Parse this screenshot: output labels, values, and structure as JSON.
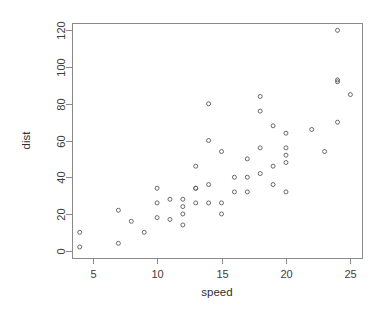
{
  "chart_data": {
    "type": "scatter",
    "title": "",
    "subtitle": "",
    "xlabel": "speed",
    "ylabel": "dist",
    "xlim": [
      3.4,
      25.9
    ],
    "ylim": [
      -4,
      124
    ],
    "xticks": [
      5,
      10,
      15,
      20,
      25
    ],
    "yticks": [
      0,
      20,
      40,
      60,
      80,
      100,
      120
    ],
    "xtick_labels": [
      "5",
      "10",
      "15",
      "20",
      "25"
    ],
    "ytick_labels": [
      "0",
      "20",
      "40",
      "60",
      "80",
      "100",
      "120"
    ],
    "grid": false,
    "legend": null,
    "legend_position": "none",
    "frame": "box",
    "marker": "open-circle",
    "marker_size": 4,
    "point_color": "#5a5a5a",
    "background_color": "#ffffff",
    "n_points": 50,
    "x": [
      4,
      4,
      7,
      7,
      8,
      9,
      10,
      10,
      10,
      11,
      11,
      12,
      12,
      12,
      12,
      13,
      13,
      13,
      13,
      14,
      14,
      14,
      14,
      15,
      15,
      15,
      16,
      16,
      17,
      17,
      17,
      18,
      18,
      18,
      18,
      19,
      19,
      19,
      20,
      20,
      20,
      20,
      20,
      22,
      23,
      24,
      24,
      24,
      24,
      25
    ],
    "y": [
      2,
      10,
      4,
      22,
      16,
      10,
      18,
      26,
      34,
      17,
      28,
      14,
      20,
      24,
      28,
      26,
      34,
      34,
      46,
      26,
      36,
      60,
      80,
      20,
      26,
      54,
      32,
      40,
      32,
      40,
      50,
      42,
      56,
      76,
      84,
      36,
      46,
      68,
      32,
      48,
      52,
      56,
      64,
      66,
      54,
      70,
      92,
      93,
      120,
      85
    ],
    "points": [
      {
        "speed": 4,
        "dist": 2
      },
      {
        "speed": 4,
        "dist": 10
      },
      {
        "speed": 7,
        "dist": 4
      },
      {
        "speed": 7,
        "dist": 22
      },
      {
        "speed": 8,
        "dist": 16
      },
      {
        "speed": 9,
        "dist": 10
      },
      {
        "speed": 10,
        "dist": 18
      },
      {
        "speed": 10,
        "dist": 26
      },
      {
        "speed": 10,
        "dist": 34
      },
      {
        "speed": 11,
        "dist": 17
      },
      {
        "speed": 11,
        "dist": 28
      },
      {
        "speed": 12,
        "dist": 14
      },
      {
        "speed": 12,
        "dist": 20
      },
      {
        "speed": 12,
        "dist": 24
      },
      {
        "speed": 12,
        "dist": 28
      },
      {
        "speed": 13,
        "dist": 26
      },
      {
        "speed": 13,
        "dist": 34
      },
      {
        "speed": 13,
        "dist": 34
      },
      {
        "speed": 13,
        "dist": 46
      },
      {
        "speed": 14,
        "dist": 26
      },
      {
        "speed": 14,
        "dist": 36
      },
      {
        "speed": 14,
        "dist": 60
      },
      {
        "speed": 14,
        "dist": 80
      },
      {
        "speed": 15,
        "dist": 20
      },
      {
        "speed": 15,
        "dist": 26
      },
      {
        "speed": 15,
        "dist": 54
      },
      {
        "speed": 16,
        "dist": 32
      },
      {
        "speed": 16,
        "dist": 40
      },
      {
        "speed": 17,
        "dist": 32
      },
      {
        "speed": 17,
        "dist": 40
      },
      {
        "speed": 17,
        "dist": 50
      },
      {
        "speed": 18,
        "dist": 42
      },
      {
        "speed": 18,
        "dist": 56
      },
      {
        "speed": 18,
        "dist": 76
      },
      {
        "speed": 18,
        "dist": 84
      },
      {
        "speed": 19,
        "dist": 36
      },
      {
        "speed": 19,
        "dist": 46
      },
      {
        "speed": 19,
        "dist": 68
      },
      {
        "speed": 20,
        "dist": 32
      },
      {
        "speed": 20,
        "dist": 48
      },
      {
        "speed": 20,
        "dist": 52
      },
      {
        "speed": 20,
        "dist": 56
      },
      {
        "speed": 20,
        "dist": 64
      },
      {
        "speed": 22,
        "dist": 66
      },
      {
        "speed": 23,
        "dist": 54
      },
      {
        "speed": 24,
        "dist": 70
      },
      {
        "speed": 24,
        "dist": 92
      },
      {
        "speed": 24,
        "dist": 93
      },
      {
        "speed": 24,
        "dist": 120
      },
      {
        "speed": 25,
        "dist": 85
      }
    ]
  }
}
